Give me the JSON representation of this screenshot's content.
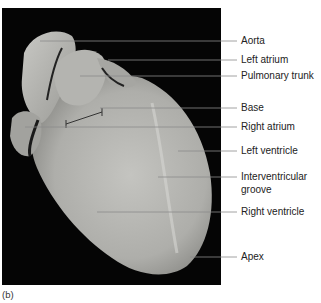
{
  "figure": {
    "panel_letter": "(b)",
    "background_color": "#050505",
    "specimen_color": "#b9b9b5",
    "leader_line_color": "#8c8c8c",
    "labels": [
      {
        "text": "Aorta",
        "y": 41,
        "x_start": 40
      },
      {
        "text": "Left atrium",
        "y": 60,
        "x_start": 108
      },
      {
        "text": "Pulmonary trunk",
        "y": 76,
        "x_start": 80
      },
      {
        "text": "Base",
        "y": 108,
        "x_start": 100
      },
      {
        "text": "Right atrium",
        "y": 127,
        "x_start": 25
      },
      {
        "text": "Left ventricle",
        "y": 151,
        "x_start": 178
      },
      {
        "text": "Interventricular",
        "text2": "groove",
        "y": 177,
        "x_start": 158
      },
      {
        "text": "Right ventricle",
        "y": 212,
        "x_start": 97
      },
      {
        "text": "Apex",
        "y": 257,
        "x_start": 190
      }
    ]
  }
}
